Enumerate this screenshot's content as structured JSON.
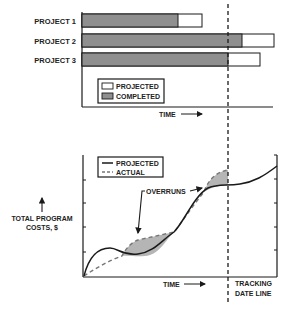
{
  "colors": {
    "completed": "#8f8f8f",
    "projected": "#ffffff",
    "overrun_fill": "#b5b5b5",
    "line": "#1a1a1a",
    "actual_dash": "#777777"
  },
  "gantt": {
    "projects": [
      {
        "label": "PROJECT 1",
        "completed_end_px": 178,
        "projected_end_px": 202
      },
      {
        "label": "PROJECT 2",
        "completed_end_px": 242,
        "projected_end_px": 274
      },
      {
        "label": "PROJECT 3",
        "completed_end_px": 228,
        "projected_end_px": 260
      }
    ],
    "legend": {
      "projected": "PROJECTED",
      "completed": "COMPLETED"
    },
    "x_label": "TIME"
  },
  "cost_chart": {
    "legend": {
      "projected": "PROJECTED",
      "actual": "ACTUAL"
    },
    "annotation": "OVERRUNS",
    "y_label_line1": "TOTAL PROGRAM",
    "y_label_line2": "COSTS, $",
    "x_label": "TIME"
  },
  "tracking_line": {
    "line1": "TRACKING",
    "line2": "DATE LINE"
  }
}
